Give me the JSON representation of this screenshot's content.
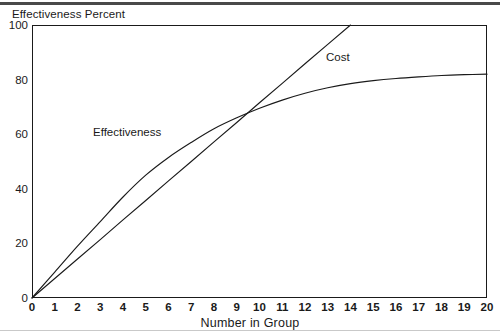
{
  "chart_data": {
    "type": "line",
    "title": "",
    "xlabel": "Number in Group",
    "ylabel": "Effectiveness Percent",
    "xlim": [
      0,
      20
    ],
    "ylim": [
      0,
      100
    ],
    "grid": false,
    "legend_position": "inline-annotations",
    "xticks": [
      "0",
      "1",
      "2",
      "3",
      "4",
      "5",
      "6",
      "7",
      "8",
      "9",
      "10",
      "11",
      "12",
      "13",
      "14",
      "15",
      "16",
      "17",
      "18",
      "19",
      "20"
    ],
    "yticks": [
      "0",
      "20",
      "40",
      "60",
      "80",
      "100"
    ],
    "xtick_values": [
      0,
      1,
      2,
      3,
      4,
      5,
      6,
      7,
      8,
      9,
      10,
      11,
      12,
      13,
      14,
      15,
      16,
      17,
      18,
      19,
      20
    ],
    "ytick_values": [
      0,
      20,
      40,
      60,
      80,
      100
    ],
    "annotations": [
      {
        "text": "Cost",
        "x": 13.0,
        "y": 89
      },
      {
        "text": "Effectiveness",
        "x": 2.7,
        "y": 64
      }
    ],
    "x": [
      0,
      1,
      2,
      3,
      4,
      5,
      6,
      7,
      8,
      9,
      10,
      11,
      12,
      13,
      14,
      15,
      16,
      17,
      18,
      19,
      20
    ],
    "series": [
      {
        "name": "Effectiveness",
        "values": [
          0,
          9.5,
          19.0,
          28.0,
          37.0,
          45.0,
          51.5,
          57.0,
          62.0,
          66.0,
          69.5,
          72.5,
          75.0,
          77.0,
          78.5,
          79.6,
          80.4,
          81.0,
          81.5,
          81.8,
          82.0
        ],
        "clipped_at_top": false
      },
      {
        "name": "Cost",
        "values": [
          0,
          7.15,
          14.3,
          21.4,
          28.6,
          35.7,
          42.9,
          50.0,
          57.2,
          64.3,
          71.5,
          78.6,
          85.8,
          92.9,
          100.0,
          null,
          null,
          null,
          null,
          null,
          null
        ],
        "clipped_at_top": true,
        "note": "straight line exits top of frame at x = 14"
      }
    ]
  },
  "labels": {
    "y_axis_title": "Effectiveness Percent",
    "x_axis_title": "Number in Group",
    "cost": "Cost",
    "effectiveness": "Effectiveness"
  },
  "colors": {
    "line": "#1a1a1a",
    "frame": "#1a1a1a",
    "text": "#1a1a1a",
    "background": "#ffffff",
    "scan_top_rule": "#3a3a3a",
    "scan_bottom_rule": "#c9c9c9"
  }
}
